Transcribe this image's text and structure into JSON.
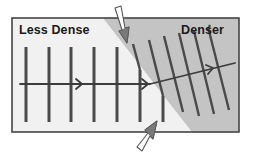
{
  "diagram": {
    "labels": {
      "less_dense": "Less Dense",
      "denser": "Denser"
    },
    "regions": [
      {
        "name": "less-dense-medium",
        "fill": "#f1f1f1"
      },
      {
        "name": "denser-medium",
        "fill": "#c4c4c4"
      }
    ],
    "colors": {
      "frame": "#444444",
      "wavefront": "#4a4a4a",
      "ray": "#3c3c3c",
      "pointer_arrow_fill": "#ffffff",
      "pointer_arrow_stroke": "#555555",
      "pointer_arrow_tip": "#777777"
    },
    "elements": {
      "wavefronts_less_dense_count": 6,
      "wavefronts_denser_count": 7,
      "incident_ray": "horizontal, left to right",
      "refracted_ray": "bent upward toward normal in denser medium",
      "pointer_arrows": [
        "top arrow pointing at boundary",
        "bottom arrow pointing at boundary"
      ]
    }
  }
}
